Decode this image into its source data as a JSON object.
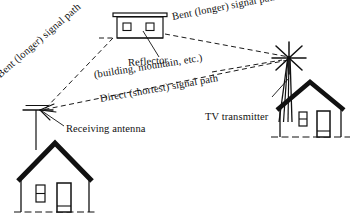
{
  "diagram": {
    "colors": {
      "ink": "#111111",
      "background": "#ffffff",
      "dashed_path": "#1a1a1a"
    },
    "labels": {
      "bent_path_left": "Bent (longer) signal path",
      "bent_path_right": "Bent (longer) signal path",
      "reflector_line1": "Reflector",
      "reflector_line2": "(building, mountain, etc.)",
      "direct_path": "Direct (shortest) signal path",
      "receiving_antenna": "Receiving antenna",
      "tv_transmitter": "TV transmitter"
    },
    "objects": [
      {
        "name": "reflector-building",
        "label": "Reflector (building, mountain, etc.)",
        "position": "top-center"
      },
      {
        "name": "tv-transmitter-tower",
        "label": "TV transmitter",
        "position": "right"
      },
      {
        "name": "receiving-antenna",
        "label": "Receiving antenna",
        "position": "left"
      },
      {
        "name": "receiver-house",
        "label": "House with receiving antenna",
        "position": "bottom-left"
      },
      {
        "name": "transmitter-house",
        "label": "House at transmitter site",
        "position": "bottom-right"
      }
    ],
    "signal_paths": [
      {
        "name": "direct-path",
        "from": "tv-transmitter-tower",
        "to": "receiving-antenna",
        "style": "dashed",
        "label": "Direct (shortest) signal path"
      },
      {
        "name": "bent-path-incoming",
        "from": "tv-transmitter-tower",
        "to": "reflector-building",
        "style": "dashed",
        "label": "Bent (longer) signal path"
      },
      {
        "name": "bent-path-outgoing",
        "from": "reflector-building",
        "to": "receiving-antenna",
        "style": "dashed",
        "label": "Bent (longer) signal path"
      }
    ]
  }
}
